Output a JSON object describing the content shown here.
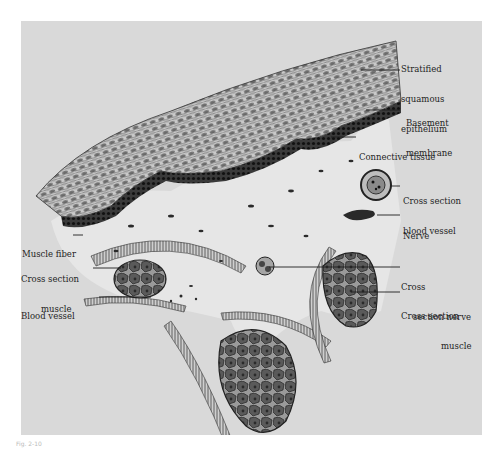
{
  "figure": {
    "type": "histology-illustration",
    "colors": {
      "background": "#ffffff",
      "plate": "#d9d9d9",
      "connective_tissue": "#e6e6e6",
      "ink": "#1e1e1e",
      "basal_layer": "#2a2a2a"
    }
  },
  "labels": {
    "stratified": [
      "Stratified",
      "squamous",
      "epithelium"
    ],
    "basement": [
      "Basement",
      "membrane"
    ],
    "connective": [
      "Connective tissue"
    ],
    "cs_blood_vessel": [
      "Cross section",
      "blood vessel"
    ],
    "nerve": [
      "Nerve"
    ],
    "cs_nerve": [
      "Cross",
      "section nerve"
    ],
    "cs_muscle_right": [
      "Cross section",
      "muscle"
    ],
    "muscle_fiber": [
      "Muscle fiber"
    ],
    "cs_muscle_left": [
      "Cross section",
      "muscle"
    ],
    "blood_vessel": [
      "Blood vessel"
    ]
  },
  "caption": "Fig. 2-10"
}
